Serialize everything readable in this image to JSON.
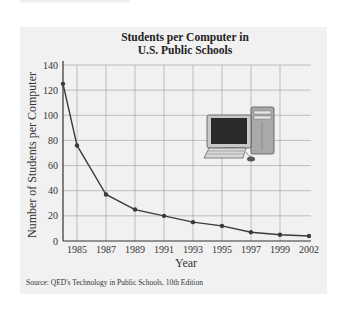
{
  "chart_data": {
    "type": "line",
    "title": "Students per Computer in U.S. Public Schools",
    "title_lines": [
      "Students per Computer in",
      "U.S. Public Schools"
    ],
    "xlabel": "Year",
    "ylabel": "Number of Students per Computer",
    "x": [
      1983.5,
      1985,
      1987,
      1989,
      1991,
      1993,
      1995,
      1997,
      1999,
      2002
    ],
    "values": [
      125,
      76,
      37,
      25,
      20,
      15,
      12,
      7,
      5,
      4
    ],
    "x_tick_labels": [
      "1985",
      "1987",
      "1989",
      "1991",
      "1993",
      "1995",
      "1997",
      "1999",
      "2002"
    ],
    "y_tick_labels": [
      "0",
      "20",
      "40",
      "60",
      "80",
      "100",
      "120",
      "140"
    ],
    "ylim": [
      0,
      140
    ],
    "grid": true,
    "legend": "none",
    "annotations": [
      "computer illustration (monitor, keyboard, tower, mouse)"
    ],
    "source": "Source: QED's Technology in Public Schools, 10th Edition"
  },
  "colors": {
    "panel_background": "#f1f1f1",
    "line": "#3a3a3a",
    "grid": "#9a9a9a"
  }
}
